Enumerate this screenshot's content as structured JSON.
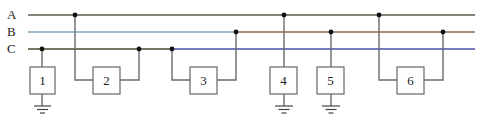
{
  "diagram": {
    "lines": [
      {
        "id": "A",
        "label": "A",
        "y": 15,
        "segments": [
          {
            "x1": 28,
            "x2": 475,
            "color": "#5a5a4a"
          }
        ]
      },
      {
        "id": "B",
        "label": "B",
        "y": 32,
        "segments": [
          {
            "x1": 28,
            "x2": 236,
            "color": "#7fa6b8"
          },
          {
            "x1": 236,
            "x2": 475,
            "color": "#8c6a4c"
          }
        ]
      },
      {
        "id": "C",
        "label": "C",
        "y": 49,
        "segments": [
          {
            "x1": 28,
            "x2": 172,
            "color": "#4b4b32"
          },
          {
            "x1": 172,
            "x2": 475,
            "color": "#4a50a8"
          }
        ]
      }
    ],
    "loads": [
      {
        "id": "1",
        "label": "1",
        "box": {
          "x": 30,
          "y": 67,
          "w": 25,
          "h": 27
        },
        "connections": [
          "C"
        ],
        "grounded": true
      },
      {
        "id": "2",
        "label": "2",
        "box": {
          "x": 93,
          "y": 67,
          "w": 27,
          "h": 27
        },
        "connections": [
          "A",
          "C"
        ],
        "grounded": false
      },
      {
        "id": "3",
        "label": "3",
        "box": {
          "x": 190,
          "y": 67,
          "w": 27,
          "h": 27
        },
        "connections": [
          "C",
          "B"
        ],
        "grounded": false
      },
      {
        "id": "4",
        "label": "4",
        "box": {
          "x": 270,
          "y": 67,
          "w": 27,
          "h": 27
        },
        "connections": [
          "A"
        ],
        "grounded": true
      },
      {
        "id": "5",
        "label": "5",
        "box": {
          "x": 317,
          "y": 67,
          "w": 27,
          "h": 27
        },
        "connections": [
          "B"
        ],
        "grounded": true
      },
      {
        "id": "6",
        "label": "6",
        "box": {
          "x": 397,
          "y": 67,
          "w": 27,
          "h": 27
        },
        "connections": [
          "A",
          "B"
        ],
        "grounded": false
      }
    ]
  }
}
